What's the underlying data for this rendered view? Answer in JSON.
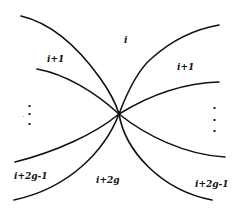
{
  "diagram": {
    "stroke_color": "#111111",
    "background_color": "#ffffff",
    "center_point": [
      119,
      114
    ],
    "regions": {
      "top": {
        "label": "i"
      },
      "upper_left": {
        "label": "i+1"
      },
      "upper_right": {
        "label": "i+1"
      },
      "lower_left": {
        "label": "i+2g-1"
      },
      "lower_right": {
        "label": "i+2g-1"
      },
      "bottom": {
        "label": "i+2g"
      }
    },
    "ellipsis_left": {
      "symbol": "⋮"
    },
    "ellipsis_right": {
      "symbol": "⋮"
    },
    "curves": [
      {
        "name": "top-left-arc",
        "from": [
          21,
          16
        ],
        "to": [
          119,
          114
        ]
      },
      {
        "name": "upper-left-arc",
        "from": [
          37,
          69
        ],
        "to": [
          119,
          114
        ]
      },
      {
        "name": "lower-left-arc",
        "from": [
          119,
          114
        ],
        "to": [
          15,
          162
        ]
      },
      {
        "name": "bottom-left-arc",
        "from": [
          119,
          114
        ],
        "to": [
          14,
          200
        ]
      },
      {
        "name": "top-right-arc",
        "from": [
          119,
          114
        ],
        "to": [
          219,
          25
        ]
      },
      {
        "name": "upper-right-arc",
        "from": [
          119,
          114
        ],
        "to": [
          219,
          82
        ]
      },
      {
        "name": "lower-right-arc",
        "from": [
          119,
          114
        ],
        "to": [
          225,
          157
        ]
      },
      {
        "name": "bottom-right-arc",
        "from": [
          119,
          114
        ],
        "to": [
          212,
          200
        ]
      }
    ]
  }
}
